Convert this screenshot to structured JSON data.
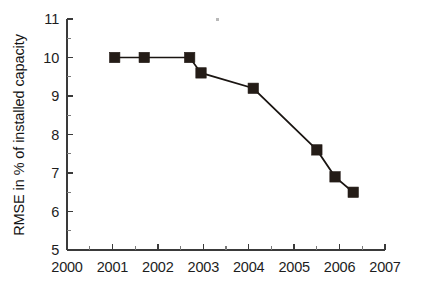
{
  "chart_data": {
    "type": "line",
    "title": "",
    "xlabel": "",
    "ylabel": "RMSE in % of installed capacity",
    "xlim": [
      2000,
      2007
    ],
    "ylim": [
      5,
      11
    ],
    "xticks": [
      2000,
      2001,
      2002,
      2003,
      2004,
      2005,
      2006,
      2007
    ],
    "xtick_labels": [
      "2000",
      "2001",
      "2002",
      "2003",
      "2004",
      "2005",
      "2006",
      "2007"
    ],
    "yticks": [
      5,
      6,
      7,
      8,
      9,
      10,
      11
    ],
    "ytick_labels": [
      "5",
      "6",
      "7",
      "8",
      "9",
      "10",
      "11"
    ],
    "minor_tick_step_x": 0.5,
    "minor_tick_step_y": 0.5,
    "grid": false,
    "legend": false,
    "legend_position": "none",
    "series": [
      {
        "name": "RMSE",
        "marker": "square",
        "marker_color": "#241c17",
        "line_color": "#1a1512",
        "x": [
          2001.05,
          2001.7,
          2002.7,
          2002.95,
          2004.1,
          2005.5,
          2005.9,
          2006.3
        ],
        "y": [
          10.0,
          10.0,
          10.0,
          9.6,
          9.2,
          7.6,
          6.9,
          6.5
        ]
      }
    ],
    "annotations": []
  },
  "figure": {
    "background_color": "#ffffff",
    "axis_color": "#3a3a3a",
    "text_color": "#1d1d1d",
    "spines": [
      "left",
      "bottom"
    ]
  }
}
